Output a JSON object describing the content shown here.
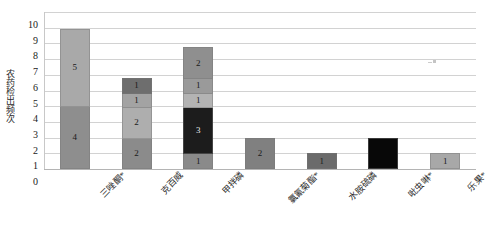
{
  "chart_data": {
    "type": "bar",
    "subtype": "stacked-bar",
    "title": "",
    "xlabel": "",
    "ylabel": "农药检出频次",
    "ylim": [
      0,
      10
    ],
    "ytick_step": 1,
    "yticks": [
      "10",
      "9",
      "8",
      "7",
      "6",
      "5",
      "4",
      "3",
      "2",
      "1",
      "0"
    ],
    "grid": true,
    "legend": false,
    "categories": [
      "三唑酮*",
      "克百威",
      "甲拌磷",
      "氯氰菊酯*",
      "水胺硫磷",
      "吡虫啉*",
      "乐果*"
    ],
    "totals": [
      9,
      6,
      8,
      2,
      1,
      2,
      1
    ],
    "series": [
      {
        "name": "层1",
        "values": [
          4,
          2,
          1,
          2,
          1,
          2,
          1
        ]
      },
      {
        "name": "层2",
        "values": [
          5,
          2,
          3,
          0,
          0,
          0,
          0
        ]
      },
      {
        "name": "层3",
        "values": [
          0,
          1,
          1,
          0,
          0,
          0,
          0
        ]
      },
      {
        "name": "层4",
        "values": [
          0,
          1,
          1,
          0,
          0,
          0,
          0
        ]
      },
      {
        "name": "层5",
        "values": [
          0,
          0,
          2,
          0,
          0,
          0,
          0
        ]
      }
    ],
    "bars": [
      {
        "category": "三唑酮*",
        "total": 9,
        "segments": [
          {
            "value": 4,
            "label": "4",
            "color": "#8e8e8e",
            "dark": false
          },
          {
            "value": 5,
            "label": "5",
            "color": "#a9a9a9",
            "dark": false
          }
        ]
      },
      {
        "category": "克百威",
        "total": 6,
        "segments": [
          {
            "value": 2,
            "label": "2",
            "color": "#8b8b8b",
            "dark": false
          },
          {
            "value": 2,
            "label": "2",
            "color": "#aeaeae",
            "dark": false
          },
          {
            "value": 1,
            "label": "1",
            "color": "#a3a3a3",
            "dark": false
          },
          {
            "value": 1,
            "label": "1",
            "color": "#6e6e6e",
            "dark": false
          }
        ]
      },
      {
        "category": "甲拌磷",
        "total": 8,
        "segments": [
          {
            "value": 1,
            "label": "1",
            "color": "#8a8a8a",
            "dark": false
          },
          {
            "value": 3,
            "label": "3",
            "color": "#1c1c1c",
            "dark": true
          },
          {
            "value": 1,
            "label": "1",
            "color": "#b3b3b3",
            "dark": false
          },
          {
            "value": 1,
            "label": "1",
            "color": "#9a9a9a",
            "dark": false
          },
          {
            "value": 2,
            "label": "2",
            "color": "#8f8f8f",
            "dark": false
          }
        ]
      },
      {
        "category": "氯氰菊酯*",
        "total": 2,
        "segments": [
          {
            "value": 2,
            "label": "2",
            "color": "#808080",
            "dark": false
          }
        ]
      },
      {
        "category": "水胺硫磷",
        "total": 1,
        "segments": [
          {
            "value": 1,
            "label": "1",
            "color": "#6b6b6b",
            "dark": false
          }
        ]
      },
      {
        "category": "吡虫啉*",
        "total": 2,
        "segments": [
          {
            "value": 2,
            "label": "",
            "color": "#080808",
            "dark": true
          }
        ]
      },
      {
        "category": "乐果*",
        "total": 1,
        "segments": [
          {
            "value": 1,
            "label": "1",
            "color": "#a8a8a8",
            "dark": false
          }
        ]
      }
    ]
  }
}
